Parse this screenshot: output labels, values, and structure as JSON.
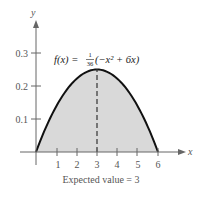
{
  "chart_data": {
    "type": "area",
    "title": "",
    "function_label": "f(x) = 1/36 (−x² + 6x)",
    "function_parts": {
      "lhs": "f(x) =",
      "num": "1",
      "den": "36",
      "rhs": "(−x² + 6x)"
    },
    "xlabel": "x",
    "ylabel": "y",
    "x_ticks": [
      "1",
      "2",
      "3",
      "4",
      "5",
      "6"
    ],
    "y_ticks": [
      "0.1",
      "0.2",
      "0.3"
    ],
    "xlim": [
      0,
      6
    ],
    "ylim": [
      0,
      0.3
    ],
    "x": [
      0,
      0.5,
      1,
      1.5,
      2,
      2.5,
      3,
      3.5,
      4,
      4.5,
      5,
      5.5,
      6
    ],
    "values": [
      0,
      0.0764,
      0.1389,
      0.1875,
      0.2222,
      0.2431,
      0.25,
      0.2431,
      0.2222,
      0.1875,
      0.1389,
      0.0764,
      0
    ],
    "annotations": [
      {
        "type": "dashed-vertical-line",
        "x": 3,
        "label": "Expected value = 3"
      }
    ],
    "caption": "Expected value = 3",
    "fill_color": "#d9d9d9",
    "curve_color": "#111111",
    "grid": false
  }
}
